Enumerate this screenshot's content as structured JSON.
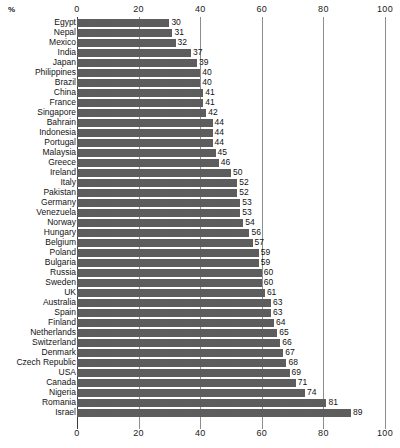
{
  "chart_data": {
    "type": "bar",
    "orientation": "horizontal",
    "title": "",
    "subtitle": "",
    "xlabel": "%",
    "ylabel": "",
    "xlim": [
      0,
      100
    ],
    "xticks": [
      0,
      20,
      40,
      60,
      80,
      100
    ],
    "grid": true,
    "grid_axis": "x",
    "legend": null,
    "bar_color": "#5b5b5b",
    "axis_color": "#8d8d8d",
    "value_labels": true,
    "axis_top": true,
    "axis_bottom": true,
    "categories": [
      "Egypt",
      "Nepal",
      "Mexico",
      "India",
      "Japan",
      "Philippines",
      "Brazil",
      "China",
      "France",
      "Singapore",
      "Bahrain",
      "Indonesia",
      "Portugal",
      "Malaysia",
      "Greece",
      "Ireland",
      "Italy",
      "Pakistan",
      "Germany",
      "Venezuela",
      "Norway",
      "Hungary",
      "Belgium",
      "Poland",
      "Bulgaria",
      "Russia",
      "Sweden",
      "UK",
      "Australia",
      "Spain",
      "Finland",
      "Netherlands",
      "Switzerland",
      "Denmark",
      "Czech Republic",
      "USA",
      "Canada",
      "Nigeria",
      "Romania",
      "Israel"
    ],
    "values": [
      30,
      31,
      32,
      37,
      39,
      40,
      40,
      41,
      41,
      42,
      44,
      44,
      44,
      45,
      46,
      50,
      52,
      52,
      53,
      53,
      54,
      56,
      57,
      59,
      59,
      60,
      60,
      61,
      63,
      63,
      64,
      65,
      66,
      67,
      68,
      69,
      71,
      74,
      81,
      89
    ]
  }
}
